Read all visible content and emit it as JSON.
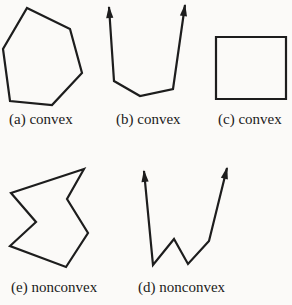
{
  "style": {
    "background": "#fbfaf8",
    "stroke_color": "#1d1d1d",
    "stroke_width": 2.2,
    "text_color": "#1b1b1b",
    "arrow_length": 11,
    "arrow_half_width": 3.6
  },
  "figures": [
    {
      "id": "a",
      "label": "(a) convex"
    },
    {
      "id": "b",
      "label": "(b) convex"
    },
    {
      "id": "c",
      "label": "(c) convex"
    },
    {
      "id": "e",
      "label": "(e) nonconvex"
    },
    {
      "id": "d",
      "label": "(d) nonconvex"
    }
  ],
  "shapes": [
    {
      "name": "convex-hexagon-a",
      "figure": "a",
      "closed": true,
      "arrows": [],
      "points": [
        [
          27,
          8
        ],
        [
          70,
          29
        ],
        [
          82,
          73
        ],
        [
          52,
          105
        ],
        [
          10,
          101
        ],
        [
          3,
          49
        ]
      ]
    },
    {
      "name": "convex-open-path-b",
      "figure": "b",
      "closed": false,
      "arrows": [
        "start",
        "end"
      ],
      "points": [
        [
          109,
          7
        ],
        [
          114,
          81
        ],
        [
          140,
          96
        ],
        [
          173,
          89
        ],
        [
          185,
          5
        ]
      ]
    },
    {
      "name": "convex-square-c",
      "figure": "c",
      "closed": true,
      "arrows": [],
      "points": [
        [
          216,
          37
        ],
        [
          286,
          37
        ],
        [
          286,
          99
        ],
        [
          216,
          99
        ]
      ]
    },
    {
      "name": "nonconvex-zigzag-polygon-e",
      "figure": "e",
      "closed": true,
      "arrows": [],
      "points": [
        [
          84,
          169
        ],
        [
          11,
          193
        ],
        [
          36,
          222
        ],
        [
          10,
          246
        ],
        [
          66,
          267
        ],
        [
          88,
          233
        ],
        [
          67,
          199
        ]
      ]
    },
    {
      "name": "nonconvex-open-path-d",
      "figure": "d",
      "closed": false,
      "arrows": [
        "start",
        "end"
      ],
      "points": [
        [
          144,
          171
        ],
        [
          153,
          265
        ],
        [
          174,
          239
        ],
        [
          188,
          264
        ],
        [
          209,
          241
        ],
        [
          227,
          168
        ]
      ]
    }
  ]
}
